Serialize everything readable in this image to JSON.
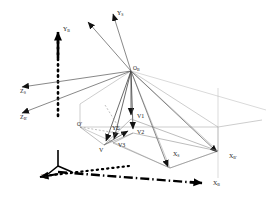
{
  "figure": {
    "type": "3d-coordinate-frame-diagram",
    "background_color": "#ffffff",
    "line_color": "#808080",
    "bold_line_color": "#000000",
    "text_color": "#1a1a1a"
  },
  "origins": [
    {
      "id": "OB",
      "label": "O",
      "sub": "B",
      "x": 131,
      "y": 71,
      "desc": "main origin of both frames"
    },
    {
      "id": "Oprime",
      "label": "O'",
      "sub": "",
      "x": 80,
      "y": 127,
      "desc": "projected origin on base plane"
    }
  ],
  "axes": [
    {
      "id": "YB",
      "label": "Y",
      "sub": "B",
      "tip_x": 58,
      "tip_y": 26,
      "lx": 62,
      "ly": 28,
      "style": "bold-dashed-vertical"
    },
    {
      "id": "YS",
      "label": "Y",
      "sub": "S",
      "tip_x": 113,
      "tip_y": 11,
      "lx": 117,
      "ly": 13,
      "style": "thin-solid"
    },
    {
      "id": "Yv",
      "label": "Y",
      "sub": "",
      "tip_x": 88,
      "tip_y": 19,
      "lx": 0,
      "ly": 0,
      "style": "thin-solid-unlabeled"
    },
    {
      "id": "ZB",
      "label": "Z",
      "sub": "B",
      "tip_x": 36,
      "tip_y": 172,
      "lx": 41,
      "ly": 176,
      "style": "bold-dashed"
    },
    {
      "id": "ZS",
      "label": "Z",
      "sub": "S",
      "tip_x": 18,
      "tip_y": 86,
      "lx": 21,
      "ly": 91,
      "style": "thin-solid"
    },
    {
      "id": "ZBp",
      "label": "Z",
      "sub": "B'",
      "tip_x": 18,
      "tip_y": 112,
      "lx": 21,
      "ly": 117,
      "style": "thin-solid"
    },
    {
      "id": "XB",
      "label": "X",
      "sub": "B",
      "tip_x": 208,
      "tip_y": 181,
      "lx": 213,
      "ly": 184,
      "style": "bold-dash-dot"
    },
    {
      "id": "XS",
      "label": "X",
      "sub": "S",
      "tip_x": 193,
      "tip_y": 170,
      "lx": 175,
      "ly": 155,
      "style": "thin-solid"
    },
    {
      "id": "XBp",
      "label": "X",
      "sub": "B'",
      "tip_x": 224,
      "tip_y": 155,
      "lx": 229,
      "ly": 157,
      "style": "thin-solid"
    }
  ],
  "vectors": [
    {
      "id": "V1",
      "label": "V1",
      "tip_x": 132,
      "tip_y": 119,
      "lx": 137,
      "ly": 117
    },
    {
      "id": "V2",
      "label": "V2",
      "tip_x": 133,
      "tip_y": 133,
      "lx": 137,
      "ly": 133
    },
    {
      "id": "V3",
      "label": "V3",
      "tip_x": 113,
      "tip_y": 143,
      "lx": 118,
      "ly": 146
    },
    {
      "id": "V",
      "label": "V",
      "tip_x": 104,
      "tip_y": 145,
      "lx": 101,
      "ly": 150
    },
    {
      "id": "YE",
      "label": "YΣ",
      "tip_x": 123,
      "tip_y": 131,
      "lx": 113,
      "ly": 129
    }
  ],
  "caption": ""
}
